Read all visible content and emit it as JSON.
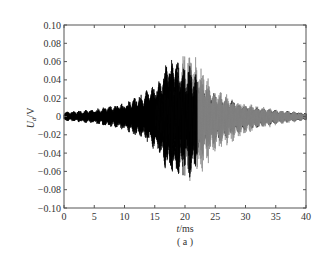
{
  "chart_data": {
    "type": "line",
    "title": "",
    "caption": "( a )",
    "xlabel": "t/ms",
    "ylabel": "U_d/V",
    "xlim": [
      0,
      40
    ],
    "ylim": [
      -0.1,
      0.1
    ],
    "xticks": [
      0,
      5,
      10,
      15,
      20,
      25,
      30,
      35,
      40
    ],
    "xtick_labels": [
      "0",
      "5",
      "10",
      "15",
      "20",
      "25",
      "30",
      "35",
      "40"
    ],
    "yticks": [
      0.1,
      0.08,
      0.06,
      0.04,
      0.02,
      0,
      -0.02,
      -0.04,
      -0.06,
      -0.08,
      -0.1
    ],
    "ytick_labels": [
      "0.10",
      "0.08",
      "0.06",
      "0.04",
      "0.02",
      "0",
      "−0.02",
      "−0.04",
      "−0.06",
      "−0.08",
      "−0.10"
    ],
    "grid": false,
    "legend": null,
    "series": [
      {
        "name": "signal (black)",
        "color": "#000000",
        "description": "dense oscillation, amplitude envelope grows from ~0.005 V at 0 ms to ~0.065 V near 17-19 ms, then decays",
        "envelope": {
          "t": [
            0,
            5,
            10,
            14,
            16,
            17,
            18,
            19,
            20,
            21,
            22,
            25,
            30,
            35,
            40
          ],
          "upper": [
            0.005,
            0.008,
            0.015,
            0.03,
            0.04,
            0.062,
            0.065,
            0.06,
            0.055,
            0.06,
            0.045,
            0.025,
            0.012,
            0.007,
            0.004
          ],
          "lower": [
            -0.005,
            -0.008,
            -0.016,
            -0.03,
            -0.045,
            -0.062,
            -0.068,
            -0.07,
            -0.065,
            -0.07,
            -0.05,
            -0.03,
            -0.015,
            -0.008,
            -0.004
          ]
        }
      },
      {
        "name": "signal (gray)",
        "color": "#888888",
        "description": "overlaid oscillation, prominent after ~19 ms",
        "envelope": {
          "t": [
            15,
            18,
            20,
            22,
            25,
            30,
            35,
            40
          ],
          "upper": [
            0.02,
            0.04,
            0.072,
            0.065,
            0.03,
            0.015,
            0.008,
            0.004
          ],
          "lower": [
            -0.02,
            -0.045,
            -0.075,
            -0.07,
            -0.04,
            -0.02,
            -0.01,
            -0.004
          ]
        }
      }
    ]
  }
}
